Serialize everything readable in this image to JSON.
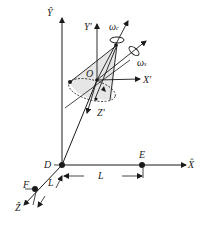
{
  "diagram": {
    "title": "",
    "labels": {
      "y_hat": "Ŷ",
      "x_hat": "X̂",
      "z_hat": "Ẑ",
      "y_prime": "Y'",
      "x_prime": "X'",
      "z_prime": "Z'",
      "origin": "O",
      "point_d": "D",
      "point_e": "E",
      "point_f": "F",
      "length_de": "L",
      "length_df": "L",
      "omega_c": "ω",
      "omega_c_sub": "c",
      "omega_s": "ω",
      "omega_s_sub": "s"
    },
    "colors": {
      "line": "#1a1a1a",
      "cone_fill": "#e6e6e6"
    }
  }
}
